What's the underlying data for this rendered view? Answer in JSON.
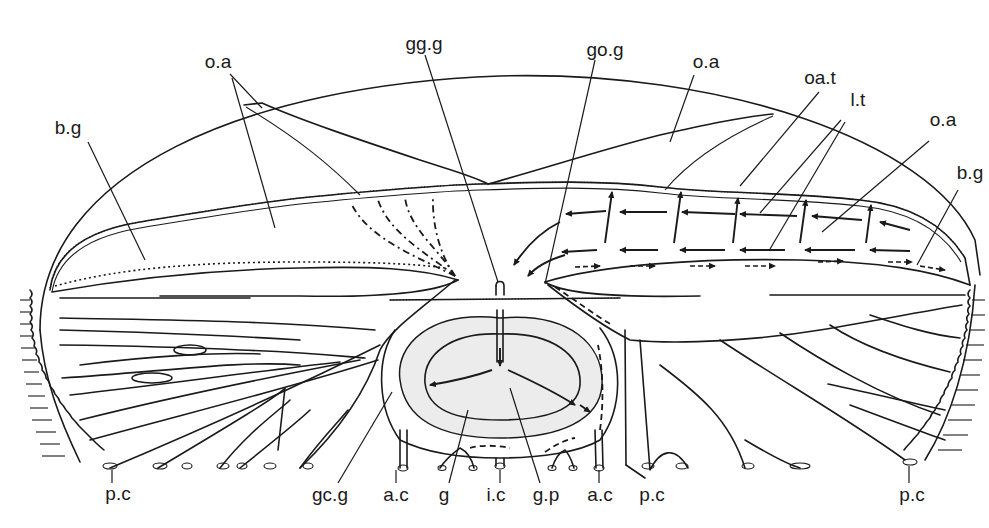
{
  "figure": {
    "type": "anatomical-diagram",
    "colors": {
      "ink": "#1a1a1a",
      "background": "#ffffff",
      "gonad_fill": "#ececec"
    }
  },
  "labels": {
    "top": [
      {
        "id": "oa_left",
        "text": "o.a"
      },
      {
        "id": "gg_g",
        "text": "gg.g"
      },
      {
        "id": "go_g",
        "text": "go.g"
      },
      {
        "id": "oa_mid",
        "text": "o.a"
      },
      {
        "id": "oa_t",
        "text": "oa.t"
      },
      {
        "id": "l_t",
        "text": "l.t"
      },
      {
        "id": "oa_right",
        "text": "o.a"
      }
    ],
    "side": [
      {
        "id": "bg_left",
        "text": "b.g"
      },
      {
        "id": "bg_right",
        "text": "b.g"
      }
    ],
    "bottom": [
      {
        "id": "pc_left",
        "text": "p.c"
      },
      {
        "id": "gc_g",
        "text": "gc.g"
      },
      {
        "id": "ac_left",
        "text": "a.c"
      },
      {
        "id": "g",
        "text": "g"
      },
      {
        "id": "i_c",
        "text": "i.c"
      },
      {
        "id": "g_p",
        "text": "g.p"
      },
      {
        "id": "ac_right",
        "text": "a.c"
      },
      {
        "id": "pc_mid",
        "text": "p.c"
      },
      {
        "id": "pc_right",
        "text": "p.c"
      }
    ]
  },
  "legend_terms": [
    "o.a",
    "oa.t",
    "l.t",
    "b.g",
    "gg.g",
    "go.g",
    "gc.g",
    "p.c",
    "a.c",
    "i.c",
    "g",
    "g.p"
  ]
}
